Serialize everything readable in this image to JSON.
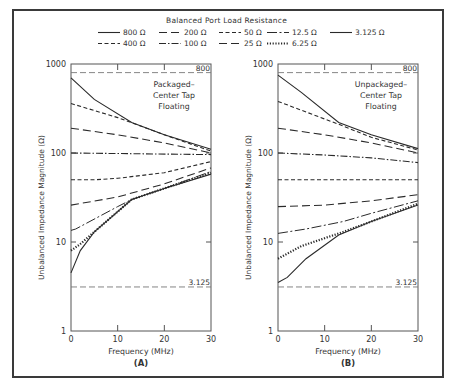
{
  "legend": {
    "title": "Balanced Port Load Resistance",
    "entries": [
      {
        "label": "800 Ω",
        "style": "solid"
      },
      {
        "label": "200 Ω",
        "style": "longdash"
      },
      {
        "label": "50 Ω",
        "style": "shortdash"
      },
      {
        "label": "12.5 Ω",
        "style": "dashdot-long"
      },
      {
        "label": "3.125 Ω",
        "style": "solid"
      },
      {
        "label": "400 Ω",
        "style": "shortdash"
      },
      {
        "label": "100 Ω",
        "style": "dashdot"
      },
      {
        "label": "25 Ω",
        "style": "longdash"
      },
      {
        "label": "6.25 Ω",
        "style": "dotted"
      }
    ]
  },
  "chart_data": [
    {
      "type": "line",
      "panel_label": "(A)",
      "annotation": [
        "Packaged–",
        "Center Tap",
        "Floating"
      ],
      "title": "",
      "xlabel": "Frequency (MHz)",
      "ylabel": "Unbalanced Impedance Magnitude (Ω)",
      "xlim": [
        0,
        30
      ],
      "ylim": [
        1,
        1000
      ],
      "yscale": "log",
      "xticks": [
        0,
        10,
        20,
        30
      ],
      "yticks": [
        1,
        10,
        100,
        1000
      ],
      "reference_lines": [
        {
          "value": 800,
          "label": "800"
        },
        {
          "value": 3.125,
          "label": "3.125"
        }
      ],
      "grid": false,
      "series": [
        {
          "name": "800 Ω",
          "style": "solid",
          "x": [
            0,
            5,
            13,
            20,
            30
          ],
          "values": [
            700,
            400,
            220,
            160,
            110
          ]
        },
        {
          "name": "400 Ω",
          "style": "shortdash",
          "x": [
            0,
            10,
            20,
            30
          ],
          "values": [
            360,
            250,
            160,
            105
          ]
        },
        {
          "name": "200 Ω",
          "style": "longdash",
          "x": [
            0,
            10,
            20,
            30
          ],
          "values": [
            190,
            160,
            130,
            100
          ]
        },
        {
          "name": "100 Ω",
          "style": "dashdot",
          "x": [
            0,
            15,
            30
          ],
          "values": [
            100,
            98,
            96
          ]
        },
        {
          "name": "50 Ω",
          "style": "shortdash",
          "x": [
            0,
            5,
            10,
            20,
            30
          ],
          "values": [
            50,
            50,
            52,
            60,
            80
          ]
        },
        {
          "name": "25 Ω",
          "style": "longdash",
          "x": [
            0,
            10,
            20,
            30
          ],
          "values": [
            26,
            32,
            45,
            68
          ]
        },
        {
          "name": "12.5 Ω",
          "style": "dashdot-long",
          "x": [
            0,
            1,
            10,
            13,
            20,
            30
          ],
          "values": [
            13.5,
            14,
            25,
            30,
            40,
            62
          ]
        },
        {
          "name": "6.25 Ω",
          "style": "dotted",
          "x": [
            0,
            2,
            5,
            13,
            20,
            30
          ],
          "values": [
            8,
            9.5,
            13,
            30,
            40,
            60
          ]
        },
        {
          "name": "3.125 Ω",
          "style": "solid",
          "x": [
            0,
            2,
            5,
            13,
            20,
            30
          ],
          "values": [
            4.5,
            8,
            13,
            30,
            40,
            58
          ]
        }
      ]
    },
    {
      "type": "line",
      "panel_label": "(B)",
      "annotation": [
        "Unpackaged–",
        "Center Tap",
        "Floating"
      ],
      "title": "",
      "xlabel": "Frequency (MHz)",
      "ylabel": "Unbalanced Impedance Magnitude (Ω)",
      "xlim": [
        0,
        30
      ],
      "ylim": [
        1,
        1000
      ],
      "yscale": "log",
      "xticks": [
        0,
        10,
        20,
        30
      ],
      "yticks": [
        1,
        10,
        100,
        1000
      ],
      "reference_lines": [
        {
          "value": 800,
          "label": "800"
        },
        {
          "value": 3.125,
          "label": "3.125"
        }
      ],
      "grid": false,
      "series": [
        {
          "name": "800 Ω",
          "style": "solid",
          "x": [
            0,
            5,
            13,
            20,
            30
          ],
          "values": [
            750,
            480,
            220,
            160,
            112
          ]
        },
        {
          "name": "400 Ω",
          "style": "shortdash",
          "x": [
            0,
            13,
            20,
            30
          ],
          "values": [
            380,
            210,
            150,
            108
          ]
        },
        {
          "name": "200 Ω",
          "style": "longdash",
          "x": [
            0,
            10,
            20,
            30
          ],
          "values": [
            190,
            160,
            130,
            100
          ]
        },
        {
          "name": "100 Ω",
          "style": "dashdot",
          "x": [
            0,
            10,
            20,
            30
          ],
          "values": [
            100,
            95,
            88,
            78
          ]
        },
        {
          "name": "50 Ω",
          "style": "shortdash",
          "x": [
            0,
            30
          ],
          "values": [
            50,
            50
          ]
        },
        {
          "name": "25 Ω",
          "style": "longdash",
          "x": [
            0,
            10,
            20,
            30
          ],
          "values": [
            25,
            26,
            29,
            34
          ]
        },
        {
          "name": "12.5 Ω",
          "style": "dashdot-long",
          "x": [
            0,
            6,
            14,
            20,
            30
          ],
          "values": [
            12.5,
            14,
            17,
            21,
            29
          ]
        },
        {
          "name": "6.25 Ω",
          "style": "dotted",
          "x": [
            0,
            5,
            14,
            20,
            30
          ],
          "values": [
            6.5,
            9,
            13,
            17,
            27
          ]
        },
        {
          "name": "3.125 Ω",
          "style": "solid",
          "x": [
            0,
            2,
            6,
            13,
            20,
            30
          ],
          "values": [
            3.5,
            4,
            6.5,
            12,
            17,
            26
          ]
        }
      ]
    }
  ]
}
